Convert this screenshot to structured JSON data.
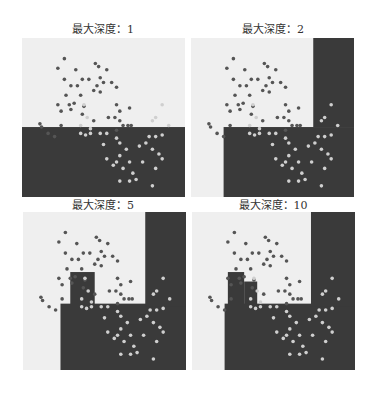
{
  "figure": {
    "panels": [
      {
        "title": "最大深度：1"
      },
      {
        "title": "最大深度：2"
      },
      {
        "title": "最大深度：5"
      },
      {
        "title": "最大深度：10"
      }
    ]
  },
  "colors": {
    "region_light": "#efefef",
    "region_dark": "#3a3a3a",
    "point_dark": "#555555",
    "point_light": "#cfcfcf"
  },
  "chart_data": [
    {
      "type": "scatter",
      "title": "最大深度：1",
      "xlabel": "",
      "ylabel": "",
      "grid": false,
      "decision_regions": [
        {
          "class": "dark",
          "rects_frac": [
            [
              0,
              0.56,
              1,
              1
            ]
          ]
        }
      ]
    },
    {
      "type": "scatter",
      "title": "最大深度：2",
      "xlabel": "",
      "ylabel": "",
      "grid": false,
      "decision_regions": [
        {
          "class": "dark",
          "rects_frac": [
            [
              0.2,
              0.56,
              1,
              1
            ],
            [
              0.75,
              0,
              1,
              0.56
            ]
          ]
        }
      ]
    },
    {
      "type": "scatter",
      "title": "最大深度：5",
      "xlabel": "",
      "ylabel": "",
      "grid": false,
      "decision_regions": [
        {
          "class": "dark",
          "rects_frac": [
            [
              0.29,
              0.38,
              0.44,
              0.6
            ],
            [
              0.23,
              0.58,
              1,
              1
            ],
            [
              0.75,
              0,
              1,
              0.6
            ]
          ]
        }
      ]
    },
    {
      "type": "scatter",
      "title": "最大深度：10",
      "xlabel": "",
      "ylabel": "",
      "grid": false,
      "decision_regions": [
        {
          "class": "dark",
          "rects_frac": [
            [
              0.22,
              0.38,
              0.32,
              0.6
            ],
            [
              0.32,
              0.44,
              0.4,
              0.6
            ],
            [
              0.2,
              0.58,
              1,
              1
            ],
            [
              0.73,
              0,
              1,
              0.6
            ]
          ]
        }
      ]
    }
  ]
}
